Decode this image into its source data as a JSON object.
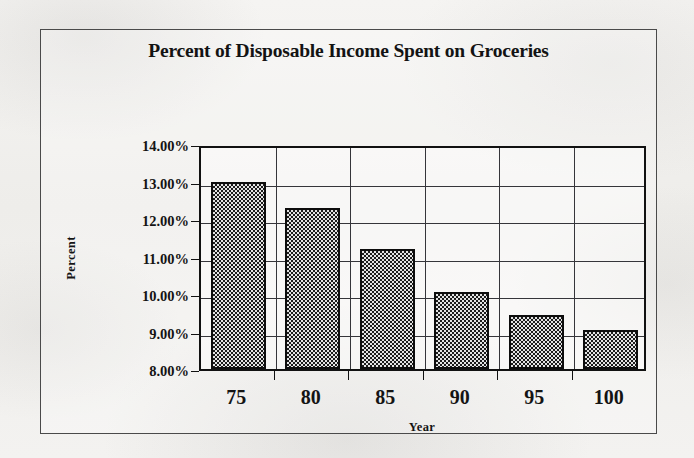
{
  "chart_data": {
    "type": "bar",
    "title": "Percent of Disposable Income Spent on Groceries",
    "xlabel": "Year",
    "ylabel": "Percent",
    "categories": [
      "75",
      "80",
      "85",
      "90",
      "95",
      "100"
    ],
    "values": [
      13.0,
      12.3,
      11.2,
      10.05,
      9.45,
      9.05
    ],
    "value_labels": [
      "13.00%",
      "12.30%",
      "11.20%",
      "10.05%",
      "9.45%",
      "9.05%"
    ],
    "ylim": [
      8,
      14
    ],
    "ytick_values": [
      14,
      13,
      12,
      11,
      10,
      9,
      8
    ],
    "ytick_labels": [
      "14.00%",
      "13.00%",
      "12.00%",
      "11.00%",
      "10.00%",
      "9.00%",
      "8.00%"
    ],
    "grid": "both",
    "legend": "none",
    "series": [
      {
        "name": "Percent of Disposable Income Spent on Groceries",
        "values": [
          13.0,
          12.3,
          11.2,
          10.05,
          9.45,
          9.05
        ]
      }
    ],
    "colors": {
      "bar_fill": "#b9b9b9",
      "bar_border": "#0d0d0d",
      "gridline": "#35353a",
      "axis": "#111111",
      "text": "#141414",
      "background": "#f2f1ef",
      "frame_border": "#4a4a4a"
    }
  }
}
